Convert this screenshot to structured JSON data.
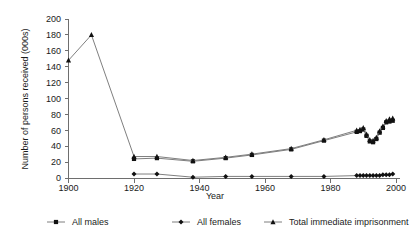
{
  "chart_data": {
    "type": "line",
    "title": "",
    "xlabel": "Year",
    "ylabel": "Number of persons received (000s)",
    "xlim": [
      1900,
      2000
    ],
    "ylim": [
      0,
      200
    ],
    "xticks": [
      1900,
      1920,
      1940,
      1960,
      1980,
      2000
    ],
    "yticks": [
      0,
      20,
      40,
      60,
      80,
      100,
      120,
      140,
      160,
      180,
      200
    ],
    "xtick_labels": [
      "1900",
      "1920",
      "1940",
      "1960",
      "1980",
      "2000"
    ],
    "ytick_labels": [
      "0",
      "20",
      "40",
      "60",
      "80",
      "100",
      "120",
      "140",
      "160",
      "180",
      "200"
    ],
    "grid": false,
    "legend_position": "bottom",
    "series": [
      {
        "name": "All males",
        "marker": "square",
        "color": "#111111",
        "points": [
          [
            1920,
            24
          ],
          [
            1927,
            25
          ],
          [
            1938,
            21
          ],
          [
            1948,
            25
          ],
          [
            1956,
            29
          ],
          [
            1968,
            36
          ],
          [
            1978,
            47
          ],
          [
            1988,
            58
          ],
          [
            1989,
            59
          ],
          [
            1990,
            61
          ],
          [
            1991,
            53
          ],
          [
            1992,
            46
          ],
          [
            1993,
            45
          ],
          [
            1994,
            49
          ],
          [
            1995,
            57
          ],
          [
            1996,
            63
          ],
          [
            1997,
            70
          ],
          [
            1998,
            71
          ],
          [
            1999,
            72
          ]
        ]
      },
      {
        "name": "All females",
        "marker": "diamond",
        "color": "#111111",
        "points": [
          [
            1920,
            5
          ],
          [
            1927,
            5
          ],
          [
            1938,
            1
          ],
          [
            1948,
            2
          ],
          [
            1956,
            2
          ],
          [
            1968,
            2
          ],
          [
            1978,
            2
          ],
          [
            1988,
            3
          ],
          [
            1989,
            3
          ],
          [
            1990,
            3
          ],
          [
            1991,
            3
          ],
          [
            1992,
            3
          ],
          [
            1993,
            3
          ],
          [
            1994,
            3
          ],
          [
            1995,
            3
          ],
          [
            1996,
            4
          ],
          [
            1997,
            4
          ],
          [
            1998,
            4
          ],
          [
            1999,
            5
          ]
        ]
      },
      {
        "name": "Total immediate imprisonment",
        "marker": "triangle",
        "color": "#111111",
        "points": [
          [
            1900,
            148
          ],
          [
            1907,
            180
          ],
          [
            1920,
            27
          ],
          [
            1927,
            27
          ],
          [
            1938,
            22
          ],
          [
            1948,
            26
          ],
          [
            1956,
            30
          ],
          [
            1968,
            37
          ],
          [
            1978,
            48
          ],
          [
            1988,
            60
          ],
          [
            1989,
            61
          ],
          [
            1990,
            63
          ],
          [
            1991,
            55
          ],
          [
            1992,
            48
          ],
          [
            1993,
            47
          ],
          [
            1994,
            51
          ],
          [
            1995,
            59
          ],
          [
            1996,
            65
          ],
          [
            1997,
            72
          ],
          [
            1998,
            74
          ],
          [
            1999,
            75
          ]
        ]
      }
    ]
  },
  "legend": {
    "items": [
      {
        "label": "All males",
        "marker": "square"
      },
      {
        "label": "All females",
        "marker": "diamond"
      },
      {
        "label": "Total immediate imprisonment",
        "marker": "triangle"
      }
    ]
  }
}
